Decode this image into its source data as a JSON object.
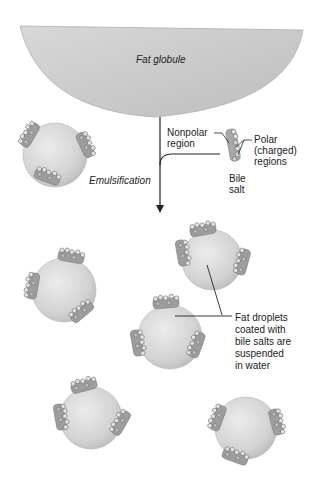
{
  "diagram": {
    "labels": {
      "fat_globule": "Fat globule",
      "nonpolar_region": "Nonpolar\nregion",
      "polar_regions": "Polar\n(charged)\nregions",
      "bile_salt": "Bile\nsalt",
      "emulsification": "Emulsification",
      "fat_droplets": "Fat droplets\ncoated with\nbile salts are\nsuspended\nin water"
    },
    "colors": {
      "globule_fill": "#c8c8c8",
      "droplet_fill": "#d6d6d6",
      "bile_salt_fill": "#a8a8a8",
      "line": "#222222",
      "background": "#ffffff"
    },
    "droplets": [
      {
        "id": "droplet-1",
        "cx": 55,
        "cy": 155,
        "r": 33
      },
      {
        "id": "droplet-2",
        "cx": 210,
        "cy": 263,
        "r": 30
      },
      {
        "id": "droplet-3",
        "cx": 63,
        "cy": 295,
        "r": 33
      },
      {
        "id": "droplet-4",
        "cx": 170,
        "cy": 338,
        "r": 33
      },
      {
        "id": "droplet-5",
        "cx": 91,
        "cy": 420,
        "r": 32
      },
      {
        "id": "droplet-6",
        "cx": 245,
        "cy": 430,
        "r": 32
      }
    ]
  }
}
